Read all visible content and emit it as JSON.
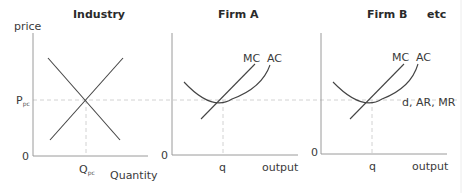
{
  "colors": {
    "background": "#ffffff",
    "axis": "#9a9a9a",
    "curve": "#444444",
    "dashed": "#cfcfcf",
    "text": "#3a3a3a"
  },
  "panels": [
    {
      "title": "Industry",
      "y_axis_label": "price",
      "x_axis_label": "Quantity",
      "origin_label": "0",
      "price_label": "P",
      "price_label_sub": "pc",
      "quantity_label": "Q",
      "quantity_label_sub": "pc",
      "curves": [
        "demand",
        "supply"
      ]
    },
    {
      "title": "Firm A",
      "x_axis_label": "output",
      "origin_label": "0",
      "quantity_label": "q",
      "mc_label": "MC",
      "ac_label": "AC"
    },
    {
      "title": "Firm B",
      "extra_title": "etc",
      "x_axis_label": "output",
      "origin_label": "0",
      "quantity_label": "q",
      "mc_label": "MC",
      "ac_label": "AC",
      "demand_label": "d, AR, MR"
    }
  ]
}
